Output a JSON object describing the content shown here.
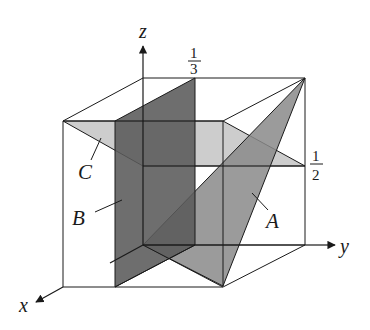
{
  "diagram": {
    "axes": {
      "x": "x",
      "y": "y",
      "z": "z"
    },
    "ticks": {
      "y_third": {
        "num": "1",
        "den": "3"
      },
      "z_half": {
        "num": "1",
        "den": "2"
      }
    },
    "planes": {
      "A": {
        "label": "A",
        "color": "#8a8a8a"
      },
      "B": {
        "label": "B",
        "color": "#5a5a5a"
      },
      "C": {
        "label": "C",
        "color": "#c4c4c4"
      }
    },
    "colors": {
      "line": "#1a1a1a",
      "background": "#ffffff"
    }
  }
}
